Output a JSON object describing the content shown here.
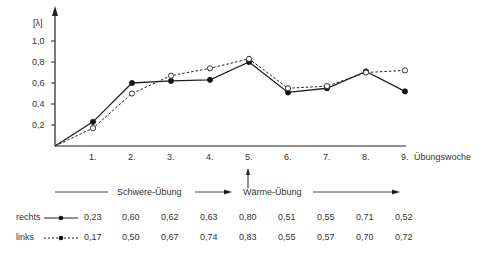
{
  "chart_data": {
    "type": "line",
    "title": "",
    "xlabel": "Übungswoche",
    "ylabel": "[λ]",
    "x": [
      "1.",
      "2.",
      "3.",
      "4.",
      "5.",
      "6.",
      "7.",
      "8.",
      "9."
    ],
    "y_ticks": [
      "0,2",
      "0,4",
      "0,6",
      "0,8",
      "1,0"
    ],
    "ylim": [
      0,
      1.1
    ],
    "series": [
      {
        "name": "rechts",
        "style": "solid, filled circles",
        "values": [
          0.23,
          0.6,
          0.62,
          0.63,
          0.8,
          0.51,
          0.55,
          0.71,
          0.52
        ]
      },
      {
        "name": "links",
        "style": "dashed, open circles",
        "values": [
          0.17,
          0.5,
          0.67,
          0.74,
          0.83,
          0.55,
          0.57,
          0.7,
          0.72
        ]
      }
    ],
    "annotations": [
      "Schwere-Übung",
      "Wärme-Übung",
      "arrow at week 5"
    ]
  },
  "axis": {
    "ylabel": "[λ]",
    "xlabel": "Übungswoche",
    "last_tick": "9."
  },
  "phases": {
    "phase1": "Schwere-Übung",
    "phase2": "Wärme-Übung"
  },
  "table": {
    "rechts": {
      "label": "rechts",
      "values": [
        "0,23",
        "0,60",
        "0,62",
        "0,63",
        "0,80",
        "0,51",
        "0,55",
        "0,71",
        "0,52"
      ]
    },
    "links": {
      "label": "links",
      "values": [
        "0,17",
        "0,50",
        "0,67",
        "0,74",
        "0,83",
        "0,55",
        "0,57",
        "0,70",
        "0,72"
      ]
    }
  }
}
